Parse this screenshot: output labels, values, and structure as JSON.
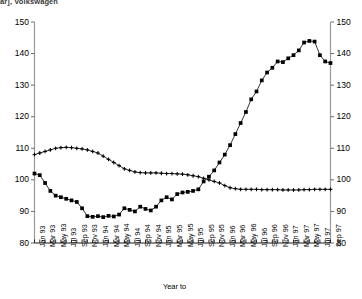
{
  "title": "ar], Volkswagen",
  "chart_data": {
    "type": "line",
    "title": "ar], Volkswagen",
    "xlabel": "Year to",
    "ylabel": "",
    "ylim": [
      80,
      150
    ],
    "yticks": [
      80,
      90,
      100,
      110,
      120,
      130,
      140,
      150
    ],
    "dual_axis": true,
    "right_ylim": [
      80,
      150
    ],
    "right_yticks": [
      80,
      90,
      100,
      110,
      120,
      130,
      140,
      150
    ],
    "grid": false,
    "legend": "none",
    "x": [
      "Jan 93",
      "Feb 93",
      "Mar 93",
      "Apr 93",
      "May 93",
      "Jun 93",
      "Jul 93",
      "Aug 93",
      "Sep 93",
      "Oct 93",
      "Nov 93",
      "Dec 93",
      "Jan 94",
      "Feb 94",
      "Mar 94",
      "Apr 94",
      "May 94",
      "Jun 94",
      "Jul 94",
      "Aug 94",
      "Sep 94",
      "Oct 94",
      "Nov 94",
      "Dec 94",
      "Jan 95",
      "Feb 95",
      "Mar 95",
      "Apr 95",
      "May 95",
      "Jun 95",
      "Jul 95",
      "Aug 95",
      "Sep 95",
      "Oct 95",
      "Nov 95",
      "Dec 95",
      "Jan 96",
      "Feb 96",
      "Mar 96",
      "Apr 96",
      "May 96",
      "Jun 96",
      "Jul 96",
      "Aug 96",
      "Sep 96",
      "Oct 96",
      "Nov 96",
      "Dec 96",
      "Jan 97",
      "Feb 97",
      "Mar 97",
      "Apr 97",
      "May 97",
      "Jun 97",
      "Jul 97",
      "Aug 97",
      "Sep 97"
    ],
    "xtick_labels": [
      "Jan 93",
      "Mar 93",
      "May 93",
      "Jul 93",
      "Sep 93",
      "Nov 93",
      "Jan 94",
      "Mar 94",
      "May 94",
      "Jul 94",
      "Sep 94",
      "Nov 94",
      "Jan 95",
      "Mar 95",
      "May 95",
      "Jul 95",
      "Sep 95",
      "Nov 95",
      "Jan 96",
      "Mar 96",
      "May 96",
      "Jul 96",
      "Sep 96",
      "Nov 96",
      "Jan 97",
      "Mar 97",
      "May 97",
      "Jul 97",
      "Sep 97"
    ],
    "series": [
      {
        "name": "series-square",
        "marker": "square",
        "values": [
          102.0,
          101.5,
          99.0,
          96.5,
          95.0,
          94.5,
          94.0,
          93.5,
          93.0,
          91.0,
          88.5,
          88.3,
          88.5,
          88.2,
          88.6,
          88.4,
          89.0,
          91.0,
          90.5,
          90.0,
          91.5,
          90.8,
          90.3,
          91.5,
          93.5,
          94.5,
          93.8,
          95.5,
          96.0,
          96.2,
          96.5,
          97.0,
          99.5,
          101.0,
          103.0,
          105.5,
          108.0,
          111.0,
          114.5,
          118.0,
          121.5,
          125.5,
          128.0,
          131.5,
          134.0,
          135.5,
          137.5,
          137.3,
          138.5,
          139.5,
          141.0,
          143.5,
          144.0,
          143.8,
          139.5,
          137.5,
          137.0
        ]
      },
      {
        "name": "series-cross",
        "marker": "cross",
        "values": [
          108.0,
          108.5,
          109.0,
          109.5,
          110.0,
          110.2,
          110.3,
          110.2,
          110.0,
          109.8,
          109.5,
          109.0,
          108.5,
          107.5,
          106.5,
          105.5,
          104.5,
          103.5,
          103.0,
          102.5,
          102.3,
          102.2,
          102.2,
          102.2,
          102.1,
          102.0,
          102.0,
          101.9,
          101.8,
          101.6,
          101.3,
          101.0,
          100.5,
          100.0,
          99.5,
          99.0,
          98.2,
          97.5,
          97.2,
          97.0,
          97.0,
          97.0,
          97.0,
          96.9,
          96.9,
          96.9,
          96.9,
          96.8,
          96.8,
          96.8,
          96.8,
          96.9,
          96.9,
          97.0,
          97.0,
          97.0,
          97.0
        ]
      }
    ]
  }
}
